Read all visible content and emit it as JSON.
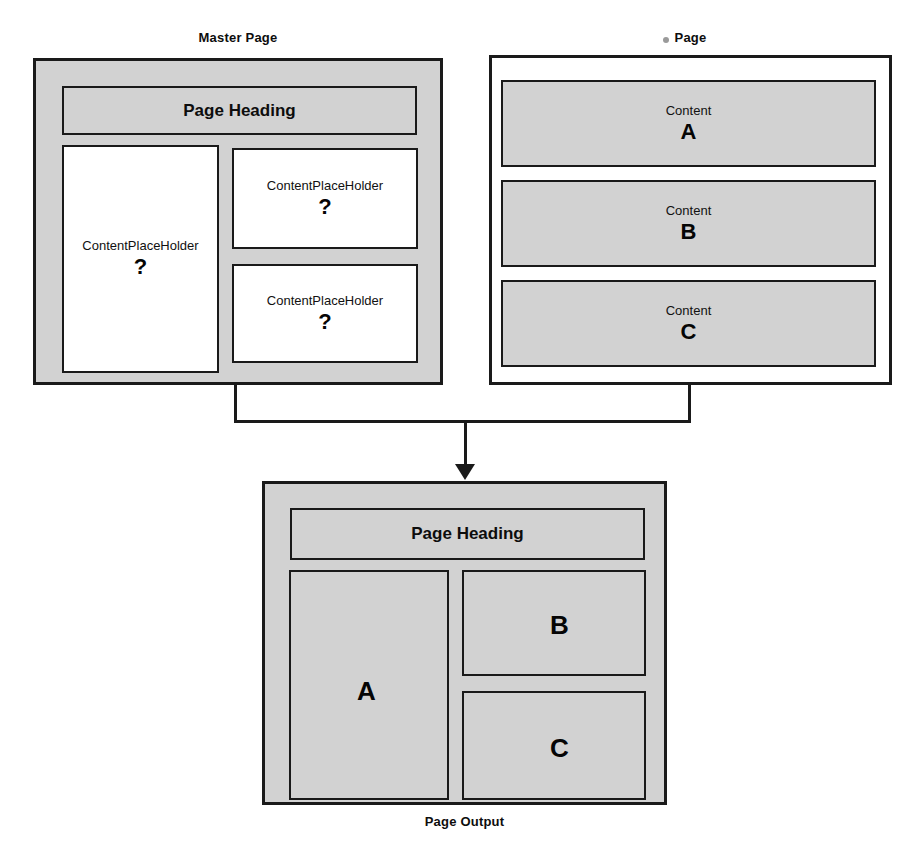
{
  "diagram": {
    "title_master": "Master Page",
    "title_page": "Page",
    "title_output": "Page Output",
    "colors": {
      "frame_fill_gray": "#d2d2d2",
      "frame_fill_white": "#ffffff",
      "stroke": "#1a1a1a",
      "text": "#111111",
      "dot_artifact": "#9a9a9a"
    }
  },
  "master_page": {
    "label": "Master Page",
    "heading": {
      "text": "Page Heading"
    },
    "placeholders": [
      {
        "title": "ContentPlaceHolder",
        "mark": "?"
      },
      {
        "title": "ContentPlaceHolder",
        "mark": "?"
      },
      {
        "title": "ContentPlaceHolder",
        "mark": "?"
      }
    ]
  },
  "page": {
    "label": "Page",
    "contents": [
      {
        "title": "Content",
        "mark": "A"
      },
      {
        "title": "Content",
        "mark": "B"
      },
      {
        "title": "Content",
        "mark": "C"
      }
    ]
  },
  "page_output": {
    "label": "Page Output",
    "heading": {
      "text": "Page Heading"
    },
    "regions": [
      {
        "mark": "A"
      },
      {
        "mark": "B"
      },
      {
        "mark": "C"
      }
    ]
  }
}
